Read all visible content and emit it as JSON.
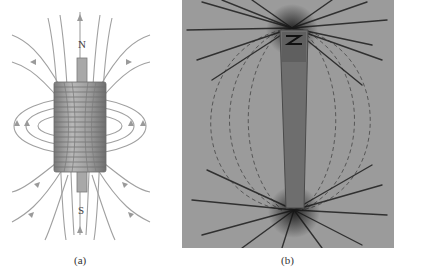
{
  "figure": {
    "panels": [
      {
        "id": "a",
        "caption": "(a)",
        "description": "Solenoid with iron core and magnetic field lines",
        "pole_labels": {
          "north": "N",
          "south": "S"
        }
      },
      {
        "id": "b",
        "caption": "(b)",
        "description": "Photograph of iron filings around a bar magnet"
      }
    ],
    "colors": {
      "field_line": "#9a9a9a",
      "coil": "#8c8c8c",
      "coil_dark": "#6f6f6f",
      "photo_bg": "#9b9b9b",
      "filings": "#1e1e1e"
    }
  }
}
